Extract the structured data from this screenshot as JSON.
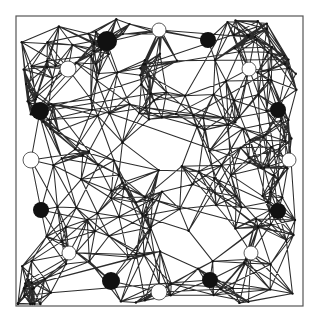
{
  "figure": {
    "width": 320,
    "height": 321,
    "frame": {
      "x": 16,
      "y": 16,
      "w": 287,
      "h": 290,
      "stroke": "#555555"
    },
    "edge_color": "#1a1a1a",
    "background": "#ffffff"
  },
  "graph": {
    "seed": 1337,
    "random_vertex_count": 190,
    "connect_radius": 62,
    "max_edges_per_vertex": 9,
    "vertex_radius": 1.2,
    "corner_clusters": [
      {
        "x": 30,
        "y": 296,
        "count": 14,
        "spread": 18
      },
      {
        "x": 40,
        "y": 110,
        "count": 10,
        "spread": 16
      },
      {
        "x": 107,
        "y": 40,
        "count": 9,
        "spread": 16
      },
      {
        "x": 245,
        "y": 38,
        "count": 8,
        "spread": 18
      },
      {
        "x": 285,
        "y": 60,
        "count": 6,
        "spread": 14
      }
    ]
  },
  "highlighted_nodes": [
    {
      "id": "b1",
      "x": 107,
      "y": 41,
      "r": 10,
      "fill": "black"
    },
    {
      "id": "b2",
      "x": 208,
      "y": 40,
      "r": 8,
      "fill": "black"
    },
    {
      "id": "b3",
      "x": 40,
      "y": 111,
      "r": 9,
      "fill": "black"
    },
    {
      "id": "b4",
      "x": 278,
      "y": 110,
      "r": 8,
      "fill": "black"
    },
    {
      "id": "b5",
      "x": 41,
      "y": 210,
      "r": 8,
      "fill": "black"
    },
    {
      "id": "b6",
      "x": 278,
      "y": 211,
      "r": 8,
      "fill": "black"
    },
    {
      "id": "b7",
      "x": 111,
      "y": 281,
      "r": 9,
      "fill": "black"
    },
    {
      "id": "b8",
      "x": 210,
      "y": 280,
      "r": 8,
      "fill": "black"
    },
    {
      "id": "w1",
      "x": 159,
      "y": 30,
      "r": 7,
      "fill": "white"
    },
    {
      "id": "w2",
      "x": 68,
      "y": 69,
      "r": 8,
      "fill": "white"
    },
    {
      "id": "w3",
      "x": 249,
      "y": 69,
      "r": 7,
      "fill": "white"
    },
    {
      "id": "w4",
      "x": 31,
      "y": 160,
      "r": 8,
      "fill": "white"
    },
    {
      "id": "w5",
      "x": 289,
      "y": 160,
      "r": 7,
      "fill": "white"
    },
    {
      "id": "w6",
      "x": 69,
      "y": 253,
      "r": 7,
      "fill": "white"
    },
    {
      "id": "w7",
      "x": 251,
      "y": 253,
      "r": 7,
      "fill": "white"
    },
    {
      "id": "w8",
      "x": 159,
      "y": 292,
      "r": 8,
      "fill": "white"
    }
  ]
}
